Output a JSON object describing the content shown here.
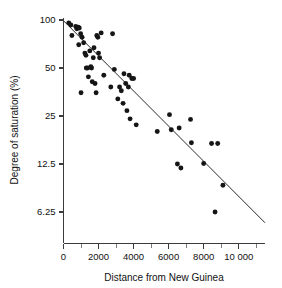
{
  "chart_data": {
    "type": "scatter",
    "title": "",
    "subtitle": "",
    "xlabel": "Distance from New Guinea",
    "ylabel": "Degree of saturation (%)",
    "xlim": [
      0,
      11500
    ],
    "ylim": [
      5.0,
      105
    ],
    "yscale": "log2",
    "xscale": "linear",
    "grid": false,
    "legend": null,
    "x_ticks": [
      {
        "value": 0,
        "label": "0"
      },
      {
        "value": 2000,
        "label": "2000"
      },
      {
        "value": 4000,
        "label": "4000"
      },
      {
        "value": 6000,
        "label": "6000"
      },
      {
        "value": 8000,
        "label": "8000"
      },
      {
        "value": 10000,
        "label": "10 000"
      }
    ],
    "x_minor_ticks": [
      1000,
      3000,
      5000,
      7000,
      9000,
      11000
    ],
    "y_ticks": [
      {
        "value": 100,
        "label": "100"
      },
      {
        "value": 50,
        "label": "50"
      },
      {
        "value": 25,
        "label": "25"
      },
      {
        "value": 12.5,
        "label": "12.5"
      },
      {
        "value": 6.25,
        "label": "6.25"
      }
    ],
    "trend_line": {
      "x": [
        0,
        11500
      ],
      "y": [
        99.0,
        5.35
      ]
    },
    "series": [
      {
        "name": "islands",
        "marker": "filled-circle",
        "color": "#151515",
        "points": [
          [
            300,
            96
          ],
          [
            420,
            93
          ],
          [
            480,
            80
          ],
          [
            700,
            91
          ],
          [
            760,
            88
          ],
          [
            840,
            90
          ],
          [
            900,
            89
          ],
          [
            870,
            70
          ],
          [
            980,
            82
          ],
          [
            1000,
            35
          ],
          [
            1060,
            78
          ],
          [
            1150,
            72
          ],
          [
            1220,
            62
          ],
          [
            1280,
            60
          ],
          [
            1300,
            50
          ],
          [
            1380,
            50
          ],
          [
            1420,
            44
          ],
          [
            1500,
            64
          ],
          [
            1560,
            51
          ],
          [
            1600,
            50
          ],
          [
            1640,
            41
          ],
          [
            1700,
            58
          ],
          [
            1740,
            67
          ],
          [
            1800,
            40
          ],
          [
            1860,
            35
          ],
          [
            1900,
            80
          ],
          [
            1960,
            78
          ],
          [
            2000,
            62
          ],
          [
            2060,
            58
          ],
          [
            2150,
            83
          ],
          [
            2300,
            45
          ],
          [
            2700,
            38
          ],
          [
            2800,
            82
          ],
          [
            2900,
            49
          ],
          [
            3100,
            32
          ],
          [
            3200,
            38
          ],
          [
            3300,
            36
          ],
          [
            3400,
            30
          ],
          [
            3450,
            46
          ],
          [
            3550,
            40
          ],
          [
            3620,
            27
          ],
          [
            3700,
            38
          ],
          [
            3750,
            45
          ],
          [
            3800,
            24
          ],
          [
            3900,
            43
          ],
          [
            4000,
            43
          ],
          [
            4150,
            22
          ],
          [
            5350,
            20
          ],
          [
            6050,
            25.5
          ],
          [
            6150,
            20.5
          ],
          [
            6500,
            12.5
          ],
          [
            6600,
            21
          ],
          [
            6700,
            11.8
          ],
          [
            7250,
            23.8
          ],
          [
            7300,
            17
          ],
          [
            8000,
            12.6
          ],
          [
            8450,
            16.8
          ],
          [
            8800,
            16.8
          ],
          [
            8650,
            6.25
          ],
          [
            9100,
            9.2
          ]
        ]
      }
    ]
  },
  "figure": {
    "background_color": "#ffffff",
    "point_color": "#151515",
    "axis_color": "#3b3b3b",
    "line_color": "#2a2a2a"
  }
}
